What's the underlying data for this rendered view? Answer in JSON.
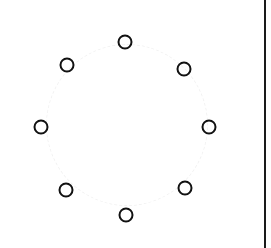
{
  "diagram": {
    "node_count": 8,
    "stroke_color": "#111111",
    "background_color": "#ffffff",
    "border_line_color": "#1a1a1a",
    "nodes": [
      {
        "id": "top",
        "x": 125,
        "y": 42
      },
      {
        "id": "top-right",
        "x": 184,
        "y": 69
      },
      {
        "id": "right",
        "x": 209,
        "y": 127
      },
      {
        "id": "bottom-right",
        "x": 185,
        "y": 188
      },
      {
        "id": "bottom",
        "x": 126,
        "y": 215
      },
      {
        "id": "bottom-left",
        "x": 66,
        "y": 190
      },
      {
        "id": "left",
        "x": 41,
        "y": 127
      },
      {
        "id": "top-left",
        "x": 67,
        "y": 65
      }
    ]
  }
}
